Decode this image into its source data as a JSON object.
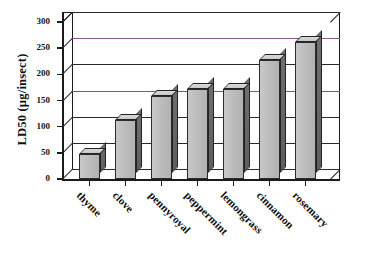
{
  "chart_data": {
    "type": "bar",
    "title": "",
    "subtitle": "",
    "xlabel": "",
    "ylabel": "LD50 (µg/insect)",
    "categories": [
      "thyme",
      "clove",
      "pennyroyal",
      "peppermint",
      "lemongrass",
      "cinnamon",
      "rosemary"
    ],
    "values": [
      48,
      113,
      158,
      172,
      172,
      227,
      262
    ],
    "series": [
      {
        "name": "LD50",
        "values": [
          48,
          113,
          158,
          172,
          172,
          227,
          262
        ]
      }
    ],
    "ylim": [
      0,
      300
    ],
    "yticks": [
      0,
      50,
      100,
      150,
      200,
      250,
      300
    ],
    "ytick_labels": [
      "0",
      "50",
      "100",
      "150",
      "200",
      "250",
      "300"
    ],
    "grid": true,
    "grid_axis": "y",
    "legend": false,
    "legend_position": "none",
    "style": "3d-bar",
    "bar_fill_color": "#c4c4c4",
    "bar_edge_color": "#2b2b2b",
    "bar_side_color": "#5e5e5e",
    "gridline_color": "#2a2a2a",
    "axis_color": "#1b1b1b",
    "background_color": "#ffffff",
    "annotations": []
  },
  "axis": {
    "y_title": "LD50 (µg/insect)"
  }
}
